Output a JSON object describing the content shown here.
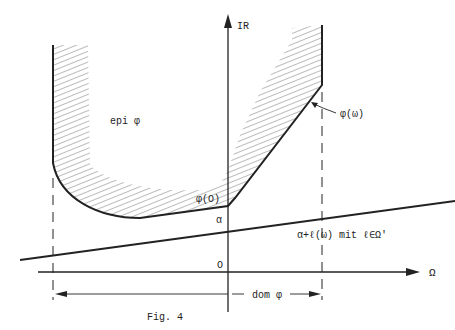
{
  "figure": {
    "caption": "Fig. 4",
    "labels": {
      "y_axis": "IR",
      "x_axis": "Ω",
      "epigraph": "epi φ",
      "function": "φ(ω)",
      "phi_zero": "φ(O)",
      "alpha": "α",
      "origin": "O",
      "affine": "α+ℓ(ω) mit ℓ∈Ω'",
      "domain": "dom φ"
    },
    "colors": {
      "ink": "#222222",
      "hatch": "#555555",
      "background": "#ffffff"
    }
  }
}
